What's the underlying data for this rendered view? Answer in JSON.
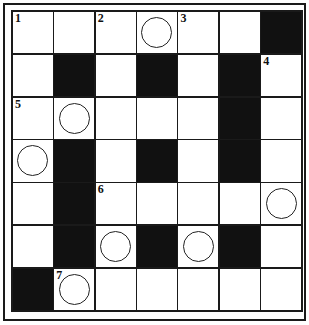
{
  "puzzle": {
    "rows": 7,
    "cols": 7,
    "grid": [
      [
        {
          "t": "w",
          "n": "1"
        },
        {
          "t": "w"
        },
        {
          "t": "w",
          "n": "2"
        },
        {
          "t": "w",
          "c": true
        },
        {
          "t": "w",
          "n": "3"
        },
        {
          "t": "w"
        },
        {
          "t": "b"
        }
      ],
      [
        {
          "t": "w"
        },
        {
          "t": "b"
        },
        {
          "t": "w"
        },
        {
          "t": "b"
        },
        {
          "t": "w"
        },
        {
          "t": "b"
        },
        {
          "t": "w",
          "n": "4"
        }
      ],
      [
        {
          "t": "w",
          "n": "5"
        },
        {
          "t": "w",
          "c": true
        },
        {
          "t": "w"
        },
        {
          "t": "w"
        },
        {
          "t": "w"
        },
        {
          "t": "b"
        },
        {
          "t": "w"
        }
      ],
      [
        {
          "t": "w",
          "c": true
        },
        {
          "t": "b"
        },
        {
          "t": "w"
        },
        {
          "t": "b"
        },
        {
          "t": "w"
        },
        {
          "t": "b"
        },
        {
          "t": "w"
        }
      ],
      [
        {
          "t": "w"
        },
        {
          "t": "b"
        },
        {
          "t": "w",
          "n": "6"
        },
        {
          "t": "w"
        },
        {
          "t": "w"
        },
        {
          "t": "w"
        },
        {
          "t": "w",
          "c": true
        }
      ],
      [
        {
          "t": "w"
        },
        {
          "t": "b"
        },
        {
          "t": "w",
          "c": true
        },
        {
          "t": "b"
        },
        {
          "t": "w",
          "c": true
        },
        {
          "t": "b"
        },
        {
          "t": "w"
        }
      ],
      [
        {
          "t": "b"
        },
        {
          "t": "w",
          "n": "7",
          "c": true
        },
        {
          "t": "w"
        },
        {
          "t": "w"
        },
        {
          "t": "w"
        },
        {
          "t": "w"
        },
        {
          "t": "w"
        }
      ]
    ]
  },
  "colors": {
    "black_cell": "#111111",
    "white_cell": "#ffffff",
    "line": "#1a1a1a"
  }
}
